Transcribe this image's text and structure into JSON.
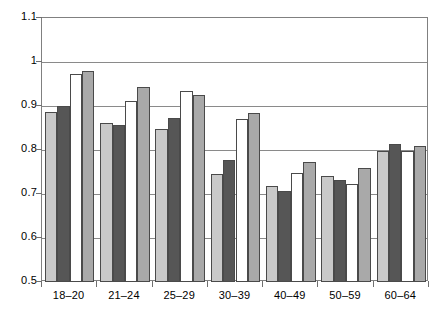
{
  "chart_data": {
    "type": "bar",
    "title": "",
    "subtitle": "",
    "xlabel": "",
    "ylabel": "",
    "ylim": [
      0.5,
      1.1
    ],
    "ytick_labels": [
      "1.1",
      "1",
      "0.9",
      "0.8",
      "0.7",
      "0.6",
      "0.5"
    ],
    "ytick_values": [
      1.1,
      1.0,
      0.9,
      0.8,
      0.7,
      0.6,
      0.5
    ],
    "grid": true,
    "legend": "none",
    "categories": [
      "18–20",
      "21–24",
      "25–29",
      "30–39",
      "40–49",
      "50–59",
      "60–64"
    ],
    "series": [
      {
        "name": "series-1",
        "color": "#c9c9c9",
        "values": [
          0.886,
          0.862,
          0.848,
          0.745,
          0.718,
          0.742,
          0.798
        ]
      },
      {
        "name": "series-2",
        "color": "#565656",
        "values": [
          0.9,
          0.856,
          0.873,
          0.778,
          0.707,
          0.731,
          0.813
        ]
      },
      {
        "name": "series-3",
        "color": "#ffffff",
        "values": [
          0.972,
          0.911,
          0.934,
          0.871,
          0.748,
          0.723,
          0.798
        ]
      },
      {
        "name": "series-4",
        "color": "#a9a9a9",
        "values": [
          0.979,
          0.943,
          0.925,
          0.883,
          0.772,
          0.76,
          0.808
        ]
      }
    ]
  }
}
